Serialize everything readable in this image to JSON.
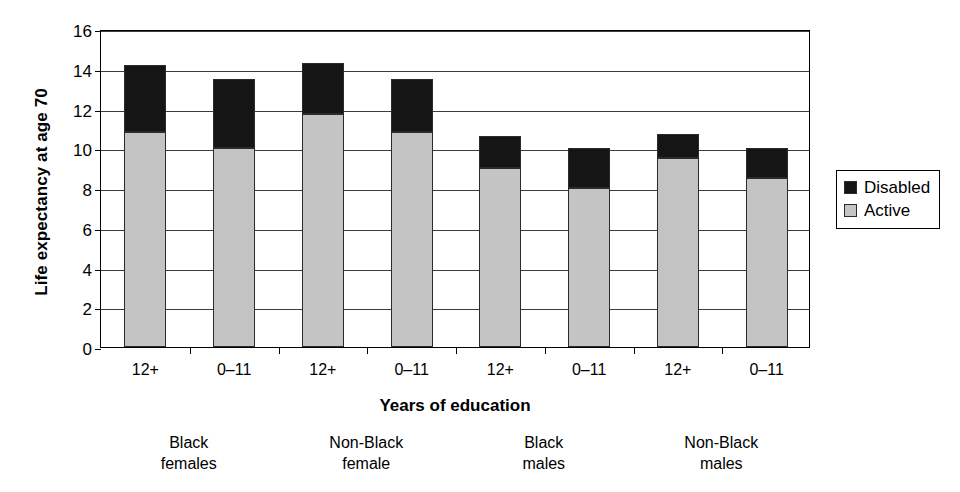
{
  "chart_data": {
    "type": "bar",
    "subtype": "stacked-vertical",
    "title": "",
    "xlabel": "Years of education",
    "ylabel": "Life expectancy at age 70",
    "ylim": [
      0,
      16
    ],
    "ytick_step": 2,
    "yticks": [
      "16",
      "14",
      "12",
      "10",
      "8",
      "6",
      "4",
      "2",
      "0"
    ],
    "grid": "horizontal",
    "legend_position": "right",
    "categories": [
      "12+",
      "0–11",
      "12+",
      "0–11",
      "12+",
      "0–11",
      "12+",
      "0–11"
    ],
    "groups": [
      {
        "line1": "Black",
        "line2": "females"
      },
      {
        "line1": "Non-Black",
        "line2": "female"
      },
      {
        "line1": "Black",
        "line2": "males"
      },
      {
        "line1": "Non-Black",
        "line2": "males"
      }
    ],
    "series": [
      {
        "name": "Active",
        "color": "#c4c4c4",
        "values": [
          10.8,
          10.0,
          11.7,
          10.8,
          9.0,
          8.0,
          9.5,
          8.5
        ]
      },
      {
        "name": "Disabled",
        "color": "#151515",
        "values": [
          3.4,
          3.5,
          2.6,
          2.7,
          1.6,
          2.0,
          1.2,
          1.5
        ]
      }
    ],
    "totals": [
      14.2,
      13.5,
      14.3,
      13.5,
      10.6,
      10.0,
      10.7,
      10.0
    ]
  },
  "legend": {
    "items": [
      {
        "label": "Disabled",
        "swatch": "black-square-swatch"
      },
      {
        "label": "Active",
        "swatch": "gray-square-swatch"
      }
    ]
  }
}
